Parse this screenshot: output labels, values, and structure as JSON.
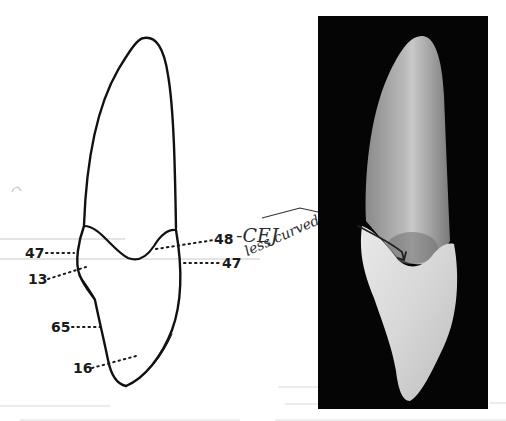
{
  "figure": {
    "title": "",
    "drawing": {
      "subject": "tooth outline (proximal view)",
      "labels": [
        {
          "id": "48",
          "text": "48",
          "side": "right"
        },
        {
          "id": "47-left",
          "text": "47",
          "side": "left"
        },
        {
          "id": "47-right",
          "text": "47",
          "side": "right"
        },
        {
          "id": "13",
          "text": "13",
          "side": "left"
        },
        {
          "id": "65",
          "text": "65",
          "side": "left"
        },
        {
          "id": "16",
          "text": "16",
          "side": "left"
        }
      ]
    },
    "annotations": {
      "cej": "-CEJ",
      "note": "less curved"
    },
    "photo": {
      "subject": "extracted tooth photograph",
      "background_color": "#050505",
      "marker": "hand-drawn arrow pointing at CEJ"
    }
  },
  "colors": {
    "ink": "#1a1a1a",
    "paper": "#ffffff",
    "ruled_lines": "#e4e4e4"
  }
}
